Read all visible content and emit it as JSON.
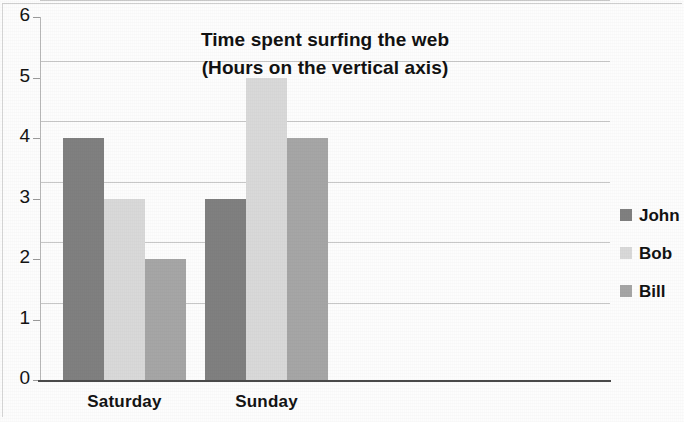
{
  "chart_data": {
    "type": "bar",
    "title": "Time spent surfing the web",
    "subtitle": "(Hours on the vertical axis)",
    "xlabel": "",
    "ylabel": "Hours",
    "categories": [
      "Saturday",
      "Sunday"
    ],
    "series": [
      {
        "name": "John",
        "values": [
          4,
          3
        ],
        "color": "#808080"
      },
      {
        "name": "Bob",
        "values": [
          3,
          5
        ],
        "color": "#d9d9d9"
      },
      {
        "name": "Bill",
        "values": [
          2,
          4
        ],
        "color": "#a6a6a6"
      }
    ],
    "ylim": [
      0,
      6
    ],
    "yticks": [
      0,
      1,
      2,
      3,
      4,
      5,
      6
    ],
    "ytick_labels": [
      "0",
      "1",
      "2",
      "3",
      "4",
      "5",
      "6"
    ],
    "grid": true,
    "grid_axis": "y",
    "legend_position": "right",
    "bar_group_gap": true,
    "background_color": "#fdfdfd",
    "gridline_color": "#c8c8c8",
    "axis_color": "#4a4a4a",
    "text_color": "#141414"
  }
}
